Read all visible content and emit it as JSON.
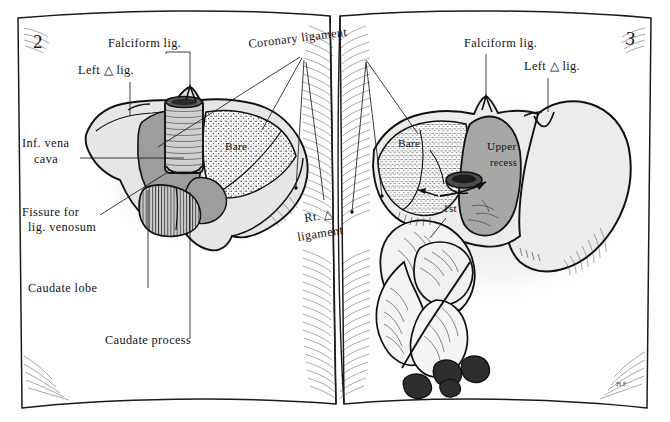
{
  "plate": {
    "kind": "anatomical-illustration",
    "medium": "open-book-spread",
    "subject": "Liver peritoneal attachments and bare area",
    "pages": {
      "left_number": "2",
      "right_number": "3"
    },
    "signature": "H.F."
  },
  "palette": {
    "paper": "#ffffff",
    "ink": "#111111",
    "page_edge": "#f4f4f2",
    "shadow_soft": "#e9e9e7",
    "liver_light": "#e4e4e2",
    "liver_mid": "#d2d2d0",
    "peritoneum_grey": "#9d9d9d",
    "recess_grey": "#a7a7a7",
    "bare_stipple": "#2a2a2a"
  },
  "left_page": {
    "number": "2",
    "caption_labels": [
      {
        "id": "falciform",
        "text": "Falciform lig.",
        "x": 108,
        "y": 47
      },
      {
        "id": "left-tri",
        "text": "Left △ lig.",
        "x": 78,
        "y": 74
      },
      {
        "id": "ivc",
        "text": "Inf. vena",
        "x": 22,
        "y": 147
      },
      {
        "id": "ivc2",
        "text": "cava",
        "x": 34,
        "y": 163
      },
      {
        "id": "fissure",
        "text": "Fissure for",
        "x": 22,
        "y": 216
      },
      {
        "id": "fissure2",
        "text": "lig. venosum",
        "x": 28,
        "y": 231
      },
      {
        "id": "caudate-lobe",
        "text": "Caudate lobe",
        "x": 28,
        "y": 292
      },
      {
        "id": "caudate-proc",
        "text": "Caudate process",
        "x": 105,
        "y": 344
      }
    ],
    "inset_labels": [
      {
        "id": "bare-left",
        "text": "Bare",
        "x": 225,
        "y": 150
      }
    ]
  },
  "gutter_labels": [
    {
      "id": "coronary",
      "text": "Coronary ligament",
      "x": 249,
      "y": 48
    },
    {
      "id": "rt-tri-1",
      "text": "Rt. △",
      "x": 305,
      "y": 222
    },
    {
      "id": "rt-tri-2",
      "text": "ligament",
      "x": 300,
      "y": 240
    }
  ],
  "right_page": {
    "number": "3",
    "caption_labels": [
      {
        "id": "falciform-r",
        "text": "Falciform lig.",
        "x": 464,
        "y": 47
      },
      {
        "id": "left-tri-r",
        "text": "Left △ lig.",
        "x": 524,
        "y": 70
      }
    ],
    "inset_labels": [
      {
        "id": "bare-right",
        "text": "Bare",
        "x": 398,
        "y": 147
      },
      {
        "id": "upper-recess-1",
        "text": "Upper",
        "x": 494,
        "y": 150
      },
      {
        "id": "upper-recess-2",
        "text": "recess",
        "x": 494,
        "y": 166
      },
      {
        "id": "first-part",
        "text": "1st",
        "x": 449,
        "y": 212
      }
    ]
  }
}
